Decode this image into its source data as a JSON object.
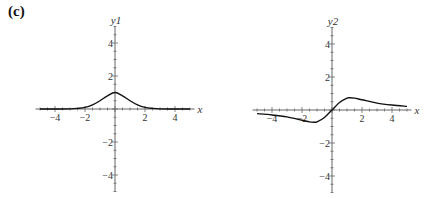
{
  "panel_label": "(c)",
  "chart_data": [
    {
      "type": "line",
      "title": "",
      "xlabel": "x",
      "ylabel": "y1",
      "xlim": [
        -5.3,
        5.3
      ],
      "ylim": [
        -5,
        5
      ],
      "xticks": [
        -4,
        -2,
        2,
        4
      ],
      "yticks": [
        -4,
        -2,
        2,
        4
      ],
      "grid": false,
      "series": [
        {
          "name": "y1",
          "x": [
            -5,
            -4,
            -3,
            -2.5,
            -2,
            -1.5,
            -1,
            -0.5,
            0,
            0.5,
            1,
            1.5,
            2,
            2.5,
            3,
            4,
            5
          ],
          "y": [
            0,
            0,
            0.01,
            0.04,
            0.1,
            0.25,
            0.5,
            0.8,
            1.0,
            0.8,
            0.5,
            0.25,
            0.1,
            0.04,
            0.01,
            0,
            0
          ]
        }
      ]
    },
    {
      "type": "line",
      "title": "",
      "xlabel": "x",
      "ylabel": "y2",
      "xlim": [
        -5.3,
        5.3
      ],
      "ylim": [
        -5,
        5
      ],
      "xticks": [
        -4,
        -2,
        2,
        4
      ],
      "yticks": [
        -4,
        -2,
        2,
        4
      ],
      "grid": false,
      "series": [
        {
          "name": "y2",
          "x": [
            -5,
            -4,
            -3,
            -2,
            -1.5,
            -1.2,
            -1,
            -0.5,
            0,
            0.5,
            1,
            1.2,
            1.5,
            2,
            3,
            4,
            5
          ],
          "y": [
            -0.22,
            -0.3,
            -0.42,
            -0.62,
            -0.72,
            -0.74,
            -0.72,
            -0.45,
            0,
            0.45,
            0.72,
            0.74,
            0.72,
            0.62,
            0.42,
            0.3,
            0.22
          ]
        }
      ]
    }
  ]
}
